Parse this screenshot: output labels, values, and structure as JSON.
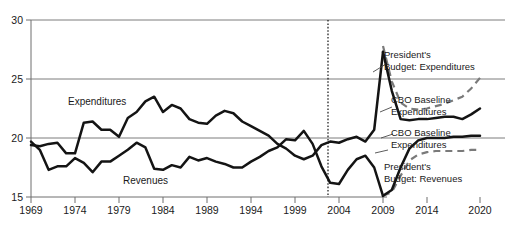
{
  "chart_data": {
    "type": "line",
    "title": "",
    "subtitle": "",
    "xlabel": "",
    "ylabel": "",
    "xlim": [
      1969,
      2020
    ],
    "ylim": [
      15,
      30
    ],
    "grid": true,
    "gridlines_y": [
      20,
      25,
      30
    ],
    "legend_position": "right-annotations",
    "x_tick_labels": [
      "1969",
      "1974",
      "1979",
      "1984",
      "1989",
      "1994",
      "1999",
      "2004",
      "2009",
      "2014",
      "2020"
    ],
    "x_tick_values": [
      1969,
      1974,
      1979,
      1984,
      1989,
      1994,
      1999,
      2004,
      2009,
      2014,
      2020
    ],
    "y_tick_labels": [
      "15",
      "20",
      "25",
      "30"
    ],
    "y_tick_values": [
      15,
      20,
      25,
      30
    ],
    "projection_divider_year": 2009,
    "series": [
      {
        "name": "Expenditures",
        "style": "solid-black",
        "label_text": "Expenditures",
        "segment": "historical",
        "x": [
          1969,
          1970,
          1971,
          1972,
          1973,
          1974,
          1975,
          1976,
          1977,
          1978,
          1979,
          1980,
          1981,
          1982,
          1983,
          1984,
          1985,
          1986,
          1987,
          1988,
          1989,
          1990,
          1991,
          1992,
          1993,
          1994,
          1995,
          1996,
          1997,
          1998,
          1999,
          2000,
          2001,
          2002,
          2003,
          2004,
          2005,
          2006,
          2007,
          2008,
          2009
        ],
        "values": [
          19.4,
          19.3,
          19.5,
          19.6,
          18.7,
          18.7,
          21.3,
          21.4,
          20.7,
          20.7,
          20.1,
          21.7,
          22.2,
          23.1,
          23.5,
          22.2,
          22.8,
          22.5,
          21.6,
          21.3,
          21.2,
          21.9,
          22.3,
          22.1,
          21.4,
          21.0,
          20.6,
          20.2,
          19.5,
          19.1,
          18.5,
          18.2,
          18.5,
          19.4,
          19.7,
          19.6,
          19.9,
          20.1,
          19.7,
          20.7,
          27.3
        ]
      },
      {
        "name": "Revenues",
        "style": "solid-black",
        "label_text": "Revenues",
        "segment": "historical",
        "x": [
          1969,
          1970,
          1971,
          1972,
          1973,
          1974,
          1975,
          1976,
          1977,
          1978,
          1979,
          1980,
          1981,
          1982,
          1983,
          1984,
          1985,
          1986,
          1987,
          1988,
          1989,
          1990,
          1991,
          1992,
          1993,
          1994,
          1995,
          1996,
          1997,
          1998,
          1999,
          2000,
          2001,
          2002,
          2003,
          2004,
          2005,
          2006,
          2007,
          2008,
          2009
        ],
        "values": [
          19.7,
          19.0,
          17.3,
          17.6,
          17.6,
          18.3,
          17.9,
          17.1,
          18.0,
          18.0,
          18.5,
          19.0,
          19.6,
          19.2,
          17.4,
          17.3,
          17.7,
          17.5,
          18.4,
          18.1,
          18.3,
          18.0,
          17.8,
          17.5,
          17.5,
          18.0,
          18.4,
          18.9,
          19.2,
          19.9,
          19.8,
          20.6,
          19.5,
          17.6,
          16.2,
          16.1,
          17.3,
          18.2,
          18.5,
          17.5,
          15.1
        ]
      },
      {
        "name": "CBO Baseline Expenditures",
        "style": "solid-black",
        "label_text": "CBO Baseline Expenditures",
        "segment": "projection-upper",
        "x": [
          2009,
          2010,
          2011,
          2012,
          2013,
          2014,
          2015,
          2016,
          2017,
          2018,
          2019,
          2020
        ],
        "values": [
          27.3,
          24.0,
          21.6,
          21.5,
          21.6,
          21.6,
          21.7,
          21.8,
          21.8,
          21.6,
          22.0,
          22.5
        ]
      },
      {
        "name": "President's Budget: Expenditures",
        "style": "dashed-gray",
        "label_text": "President's Budget: Expenditures",
        "segment": "projection-upper",
        "x": [
          2009,
          2010,
          2011,
          2012,
          2013,
          2014,
          2015,
          2016,
          2017,
          2018,
          2019,
          2020
        ],
        "values": [
          27.8,
          24.8,
          23.0,
          22.5,
          22.4,
          22.5,
          22.7,
          22.9,
          23.2,
          23.5,
          24.2,
          25.1
        ]
      },
      {
        "name": "CBO Baseline Expenditures",
        "style": "solid-black",
        "label_text": "CBO Baseline Expenditures",
        "segment": "projection-lower",
        "x": [
          2009,
          2010,
          2011,
          2012,
          2013,
          2014,
          2015,
          2016,
          2017,
          2018,
          2019,
          2020
        ],
        "values": [
          15.1,
          15.6,
          17.5,
          19.1,
          19.8,
          20.0,
          20.0,
          20.0,
          20.1,
          20.1,
          20.2,
          20.2
        ]
      },
      {
        "name": "President's Budget: Revenues",
        "style": "dashed-gray",
        "label_text": "President's Budget: Revenues",
        "segment": "projection-lower",
        "x": [
          2009,
          2010,
          2011,
          2012,
          2013,
          2014,
          2015,
          2016,
          2017,
          2018,
          2019,
          2020
        ],
        "values": [
          15.1,
          15.4,
          16.8,
          18.1,
          18.6,
          18.8,
          18.9,
          18.9,
          18.9,
          18.9,
          19.0,
          19.0
        ]
      }
    ],
    "annotations": [
      {
        "text": "Expenditures",
        "role": "inline-series-label"
      },
      {
        "text": "Revenues",
        "role": "inline-series-label"
      },
      {
        "text": "President's",
        "role": "legend-line-1"
      },
      {
        "text": "Budget: Expenditures",
        "role": "legend-line-2"
      },
      {
        "text": "CBO Baseline",
        "role": "legend-line-1"
      },
      {
        "text": "Expenditures",
        "role": "legend-line-2"
      },
      {
        "text": "CBO Baseline",
        "role": "legend-line-1"
      },
      {
        "text": "Expenditures",
        "role": "legend-line-2"
      },
      {
        "text": "President's",
        "role": "legend-line-1"
      },
      {
        "text": "Budget: Revenues",
        "role": "legend-line-2"
      }
    ],
    "colors": {
      "historical_line": "#141414",
      "cbo_line": "#141414",
      "president_line": "#7a7a7a",
      "gridline": "#6e6e6e",
      "axis": "#6e6e6e",
      "text": "#1a1a1a",
      "background": "#ffffff",
      "divider": "#111111"
    }
  },
  "axis": {
    "y_ticks": [
      "15",
      "20",
      "25",
      "30"
    ],
    "x_ticks": [
      "1969",
      "1974",
      "1979",
      "1984",
      "1989",
      "1994",
      "1999",
      "2004",
      "2009",
      "2014",
      "2020"
    ]
  },
  "series_labels": {
    "expenditures": "Expenditures",
    "revenues": "Revenues"
  },
  "legend": {
    "pres_exp_l1": "President's",
    "pres_exp_l2": "Budget: Expenditures",
    "cbo_exp_l1": "CBO Baseline",
    "cbo_exp_l2": "Expenditures",
    "cbo_rev_l1": "CBO Baseline",
    "cbo_rev_l2": "Expenditures",
    "pres_rev_l1": "President's",
    "pres_rev_l2": "Budget: Revenues"
  }
}
